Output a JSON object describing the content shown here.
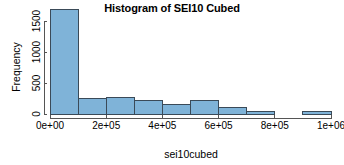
{
  "chart_data": {
    "type": "bar",
    "title": "Histogram of SEI10 Cubed",
    "xlabel": "sei10cubed",
    "ylabel": "Frequency",
    "grid": false,
    "legend": false,
    "xlim": [
      0,
      1000000
    ],
    "ylim": [
      0,
      1700
    ],
    "xticks": [
      0,
      200000,
      400000,
      600000,
      800000,
      1000000
    ],
    "xtick_labels": [
      "0e+00",
      "2e+05",
      "4e+05",
      "6e+05",
      "8e+05",
      "1e+06"
    ],
    "yticks": [
      0,
      500,
      1000,
      1500
    ],
    "ytick_labels": [
      "0",
      "500",
      "1000",
      "1500"
    ],
    "bin_width": 100000,
    "bin_edges": [
      0,
      100000,
      200000,
      300000,
      400000,
      500000,
      600000,
      700000,
      800000,
      900000,
      1000000
    ],
    "categories": [
      "0-1e+05",
      "1e+05-2e+05",
      "2e+05-3e+05",
      "3e+05-4e+05",
      "4e+05-5e+05",
      "5e+05-6e+05",
      "6e+05-7e+05",
      "7e+05-8e+05",
      "8e+05-9e+05",
      "9e+05-1e+06"
    ],
    "values": [
      1690,
      250,
      270,
      215,
      150,
      220,
      110,
      45,
      0,
      40
    ],
    "bar_fill_color": "#7FB3D8",
    "bar_edge_color": "#3A4A58",
    "axis_color": "#555555",
    "text_color": "#000000"
  }
}
